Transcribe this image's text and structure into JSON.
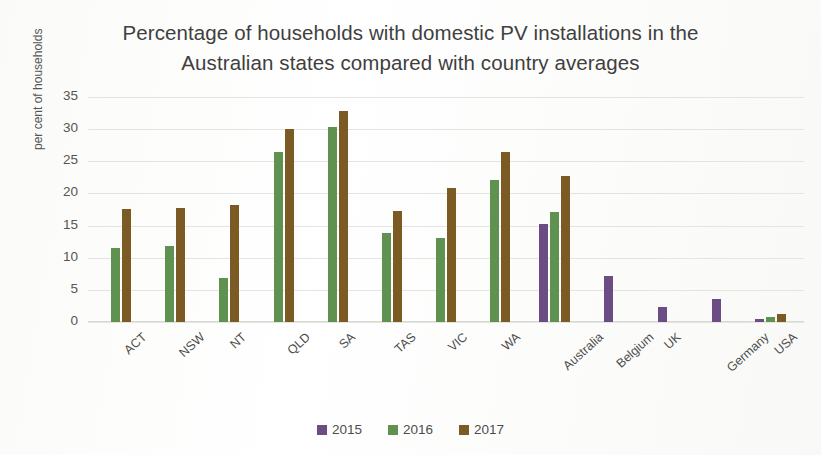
{
  "chart_data": {
    "type": "bar",
    "title": "Percentage of households with domestic PV installations in the Australian states compared with country averages",
    "title_line1": "Percentage of households with domestic PV installations in the",
    "title_line2": "Australian states compared with country averages",
    "xlabel": "",
    "ylabel": "per cent of households",
    "ylim": [
      0,
      35
    ],
    "yticks": [
      0,
      5,
      10,
      15,
      20,
      25,
      30,
      35
    ],
    "grid": true,
    "legend_position": "bottom",
    "categories": [
      "ACT",
      "NSW",
      "NT",
      "QLD",
      "SA",
      "TAS",
      "VIC",
      "WA",
      "Australia",
      "Belgium",
      "UK",
      "Germany",
      "USA"
    ],
    "series": [
      {
        "name": "2015",
        "color": "#6b4d84",
        "values": [
          null,
          null,
          null,
          null,
          null,
          null,
          null,
          null,
          15.2,
          7.2,
          2.3,
          3.6,
          0.5
        ]
      },
      {
        "name": "2016",
        "color": "#5f9150",
        "values": [
          11.5,
          11.8,
          6.8,
          26.5,
          30.4,
          13.8,
          13.0,
          22.1,
          17.1,
          null,
          null,
          null,
          0.8
        ]
      },
      {
        "name": "2017",
        "color": "#7c5a23",
        "values": [
          17.6,
          17.8,
          18.2,
          30.1,
          32.8,
          17.2,
          20.9,
          26.5,
          22.7,
          null,
          null,
          null,
          1.2
        ]
      }
    ]
  },
  "legend": {
    "items": [
      {
        "label": "2015",
        "color": "#6b4d84"
      },
      {
        "label": "2016",
        "color": "#5f9150"
      },
      {
        "label": "2017",
        "color": "#7c5a23"
      }
    ]
  }
}
